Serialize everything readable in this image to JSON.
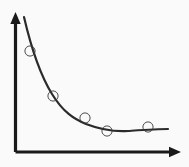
{
  "figure": {
    "kind": "scatter-plot-with-fitted-curve",
    "background_color": "#fafafa",
    "width": 189,
    "height": 167,
    "title": "",
    "subtitle": "",
    "axis_color": "#1a1a1a",
    "curve_color": "#2b2b2b",
    "marker_color": "#3a3a3a",
    "axis_stroke_width": 3.2,
    "curve_stroke_width": 2.2,
    "marker_stroke_width": 0.9,
    "marker_radius": 5.1
  },
  "axes": {
    "x_axis": {
      "label": "",
      "origin_x": 15.5,
      "origin_y": 152,
      "end_x": 172,
      "end_y": 152,
      "arrow_tip_x": 181,
      "arrow_tip_y": 152,
      "arrow_half_height": 5.2,
      "has_arrow": true,
      "tick_labels": []
    },
    "y_axis": {
      "label": "",
      "origin_x": 15.5,
      "origin_y": 152,
      "end_x": 15.5,
      "end_y": 21,
      "arrow_tip_x": 15.5,
      "arrow_tip_y": 12,
      "arrow_half_width": 5.2,
      "has_arrow": true,
      "tick_labels": []
    },
    "grid": "off",
    "legend": "none"
  },
  "chart_data": {
    "type": "scatter",
    "title": "",
    "xlabel": "",
    "ylabel": "",
    "grid": false,
    "legend": null,
    "xlim": [
      0,
      189
    ],
    "ylim": [
      0,
      167
    ],
    "series": [
      {
        "name": "observations",
        "marker": "open-circle",
        "points_px": [
          {
            "x": 30,
            "y": 51
          },
          {
            "x": 53,
            "y": 96
          },
          {
            "x": 85,
            "y": 118
          },
          {
            "x": 107,
            "y": 131
          },
          {
            "x": 148,
            "y": 127
          }
        ],
        "x": [
          30,
          53,
          85,
          107,
          148
        ],
        "y": [
          51,
          96,
          118,
          131,
          127
        ],
        "values_normalized_x": [
          0.09,
          0.23,
          0.42,
          0.56,
          0.81
        ],
        "values_normalized_y": [
          0.72,
          0.4,
          0.24,
          0.15,
          0.18
        ]
      },
      {
        "name": "fitted-decay-curve",
        "marker": "none",
        "path": "M 24,17 C 31,47 39,73 52,94 C 63,112 74,119 86,124 C 99,129 112,132 128,131 C 143,130 157,129 168,129",
        "start_px": {
          "x": 24,
          "y": 17
        },
        "end_px": {
          "x": 168,
          "y": 129
        },
        "shape": "monotonic-decreasing-asymptotic"
      }
    ]
  }
}
